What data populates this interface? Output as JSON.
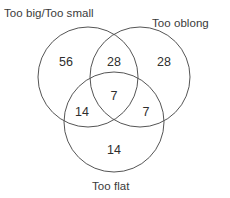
{
  "diagram": {
    "type": "venn",
    "set_count": 3,
    "background_color": "#ffffff",
    "stroke_color": "#555555",
    "text_color": "#3a3a3a",
    "sets": [
      {
        "id": "too-big-too-small",
        "label": "Too big/Too small",
        "position": "top-left"
      },
      {
        "id": "too-oblong",
        "label": "Too oblong",
        "position": "top-right"
      },
      {
        "id": "too-flat",
        "label": "Too flat",
        "position": "bottom"
      }
    ],
    "regions": [
      {
        "id": "only-big-small",
        "value": "56",
        "members": [
          "too-big-too-small"
        ]
      },
      {
        "id": "big-small-and-oblong",
        "value": "28",
        "members": [
          "too-big-too-small",
          "too-oblong"
        ]
      },
      {
        "id": "only-oblong",
        "value": "28",
        "members": [
          "too-oblong"
        ]
      },
      {
        "id": "all-three",
        "value": "7",
        "members": [
          "too-big-too-small",
          "too-oblong",
          "too-flat"
        ]
      },
      {
        "id": "big-small-and-flat",
        "value": "14",
        "members": [
          "too-big-too-small",
          "too-flat"
        ]
      },
      {
        "id": "oblong-and-flat",
        "value": "7",
        "members": [
          "too-oblong",
          "too-flat"
        ]
      },
      {
        "id": "only-flat",
        "value": "14",
        "members": [
          "too-flat"
        ]
      }
    ]
  }
}
